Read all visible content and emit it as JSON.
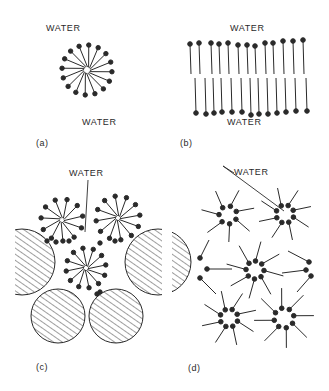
{
  "figure": {
    "panels": [
      {
        "id": "a",
        "caption": "(a)",
        "label_top": "WATER",
        "label_bottom": "WATER",
        "structure": "spherical micelle"
      },
      {
        "id": "b",
        "caption": "(b)",
        "label_top": "WATER",
        "label_bottom": "WATER",
        "structure": "lipid bilayer"
      },
      {
        "id": "c",
        "caption": "(c)",
        "label_top": "WATER",
        "structure": "micelles packed among hatched particles"
      },
      {
        "id": "d",
        "caption": "(d)",
        "label_top": "WATER",
        "structure": "reverse micelles"
      }
    ],
    "colors": {
      "ink": "#2a2a2a",
      "background": "#ffffff"
    }
  }
}
